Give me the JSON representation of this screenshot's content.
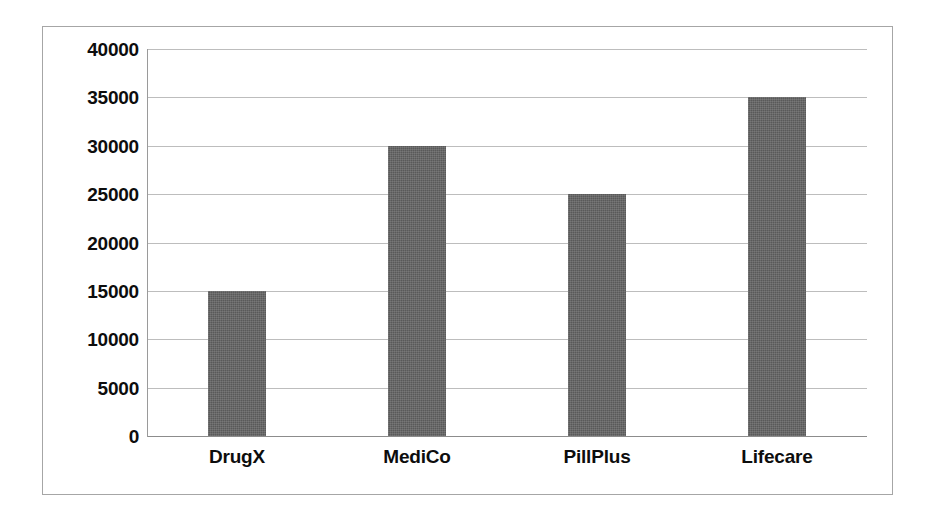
{
  "chart_data": {
    "type": "bar",
    "title": "",
    "subtitle": "",
    "xlabel": "",
    "ylabel": "",
    "categories": [
      "DrugX",
      "MediCo",
      "PillPlus",
      "Lifecare"
    ],
    "values": [
      15000,
      30000,
      25000,
      35000
    ],
    "series": [
      {
        "name": "",
        "values": [
          15000,
          30000,
          25000,
          35000
        ]
      }
    ],
    "ylim": [
      0,
      40000
    ],
    "ytick_step": 5000,
    "ytick_labels": [
      "40000",
      "35000",
      "30000",
      "25000",
      "20000",
      "15000",
      "10000",
      "5000",
      "0"
    ],
    "ytick_values": [
      40000,
      35000,
      30000,
      25000,
      20000,
      15000,
      10000,
      5000,
      0
    ],
    "grid": true,
    "grid_axis": "y",
    "legend": false,
    "legend_position": "none",
    "bar_color": "#595959",
    "grid_color": "#bdbdbd",
    "axis_color": "#9a9a9a",
    "border_color": "#a6a6a6",
    "background_color": "#ffffff",
    "text_color": "#0d0d0d",
    "annotations": []
  }
}
